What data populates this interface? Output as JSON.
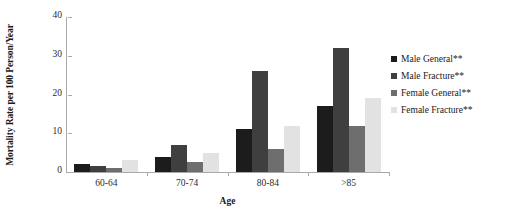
{
  "chart_data": {
    "type": "bar",
    "title": "",
    "xlabel": "Age",
    "ylabel": "Mortality Rate per 100 Person/Year",
    "categories": [
      "60-64",
      "70-74",
      "80-84",
      ">85"
    ],
    "ylim": [
      0,
      40
    ],
    "yticks": [
      0,
      10,
      20,
      30,
      40
    ],
    "ytick_labels": [
      "0",
      "10",
      "20",
      "30",
      "40"
    ],
    "grid": false,
    "legend_position": "right",
    "series": [
      {
        "name": "Male General**",
        "color": "#1c1c1c",
        "values": [
          2,
          4,
          11,
          17
        ]
      },
      {
        "name": "Male Fracture**",
        "color": "#3f3f3f",
        "values": [
          1.5,
          7,
          26,
          32
        ]
      },
      {
        "name": "Female General**",
        "color": "#6e6e6e",
        "values": [
          1,
          2.5,
          6,
          12
        ]
      },
      {
        "name": "Female Fracture**",
        "color": "#e2e2e2",
        "values": [
          3,
          5,
          12,
          19
        ]
      }
    ]
  },
  "axis": {
    "line_color": "#aaaaaa",
    "tick_color": "#aaaaaa"
  }
}
